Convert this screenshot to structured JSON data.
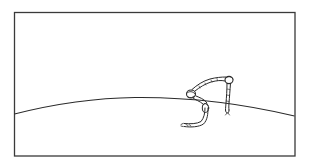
{
  "illustration": {
    "subject": "snake-on-horizon",
    "caption": "",
    "colors": {
      "background": "#ffffff",
      "ink": "#2a2a2a",
      "frame": "#3a3a3a"
    },
    "frame": {
      "x": 14,
      "y": 12,
      "width": 281,
      "height": 144
    },
    "horizon": {
      "start": [
        14,
        114
      ],
      "peak": [
        135,
        97
      ],
      "end": [
        295,
        116
      ]
    }
  }
}
